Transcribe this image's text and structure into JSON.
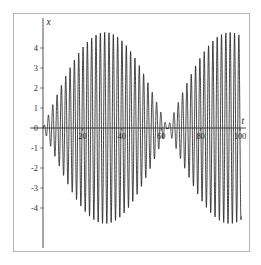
{
  "figure": {
    "width": 261,
    "height": 265,
    "background_color": "#ffffff",
    "frame_color": "#b4b4b4",
    "curve_color": "#111111",
    "axis_color": "#3a3a3a"
  },
  "chart_data": {
    "type": "line",
    "title": "",
    "subtitle": "",
    "xlabel": "t",
    "ylabel": "x",
    "xlim": [
      0,
      103
    ],
    "ylim": [
      -5.0,
      5.0
    ],
    "grid": false,
    "legend": null,
    "xticks": [
      20,
      40,
      60,
      80,
      100
    ],
    "xtick_labels": [
      "20",
      "40",
      "60",
      "80",
      "100"
    ],
    "yticks": [
      -4,
      -3,
      -2,
      -1,
      0,
      1,
      2,
      3,
      4
    ],
    "ytick_labels": [
      "-4",
      "-3",
      "-2",
      "-1",
      "0",
      "1",
      "2",
      "3",
      "4"
    ],
    "series": [
      {
        "name": "x(t)",
        "formula_envelope_amplitude": 4.78,
        "carrier_frequency_rad": 2.86,
        "envelope_frequency_rad": 0.0497,
        "envelope_node_t": 63.2,
        "envelope_peak_t": 31.5,
        "samples_note": "curve generated parametrically from envelope and carrier parameters"
      }
    ],
    "envelope_points": {
      "t": [
        0,
        5,
        10,
        15,
        20,
        25,
        30,
        35,
        40,
        45,
        50,
        55,
        60,
        63,
        66,
        70,
        75,
        80,
        85,
        90,
        95,
        100
      ],
      "upper": [
        0.0,
        0.86,
        1.67,
        2.52,
        3.28,
        3.95,
        4.45,
        4.72,
        4.74,
        4.52,
        4.05,
        3.34,
        1.87,
        0.35,
        1.22,
        2.28,
        3.28,
        4.01,
        4.49,
        4.72,
        4.78,
        4.75
      ],
      "lower": [
        0.0,
        -0.86,
        -1.67,
        -2.52,
        -3.28,
        -3.95,
        -4.45,
        -4.72,
        -4.74,
        -4.52,
        -4.05,
        -3.34,
        -1.87,
        -0.35,
        -1.22,
        -2.28,
        -3.28,
        -4.01,
        -4.49,
        -4.72,
        -4.78,
        -4.75
      ]
    }
  },
  "axes": {
    "x_axis_label": "t",
    "y_axis_label": "x"
  }
}
